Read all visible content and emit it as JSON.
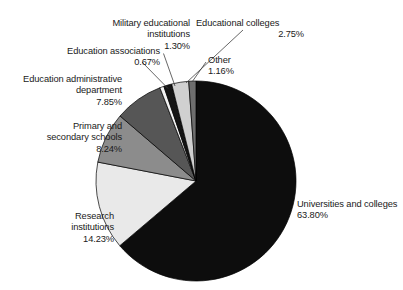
{
  "chart_data": {
    "type": "pie",
    "title": "",
    "subtitle": "",
    "xlabel": "",
    "ylabel": "",
    "legend_position": "none",
    "grid": false,
    "value_unit": "%",
    "start_angle_deg": 0,
    "direction": "clockwise",
    "categories": [
      "Universities and colleges",
      "Research institutions",
      "Primary and secondary schools",
      "Education administrative department",
      "Education associations",
      "Military educational institutions",
      "Educational colleges",
      "Other"
    ],
    "values": [
      63.8,
      14.23,
      8.24,
      7.85,
      0.67,
      1.3,
      2.75,
      1.16
    ],
    "slices": [
      {
        "label": "Universities and colleges",
        "value": 63.8,
        "value_text": "63.80%",
        "color": "#0d0d0d"
      },
      {
        "label": "Research institutions",
        "value": 14.23,
        "value_text": "14.23%",
        "color": "#e9e9e9"
      },
      {
        "label": "Primary and secondary schools",
        "value": 8.24,
        "value_text": "8.24%",
        "color": "#8c8c8c"
      },
      {
        "label": "Education administrative department",
        "value": 7.85,
        "value_text": "7.85%",
        "color": "#565656"
      },
      {
        "label": "Education associations",
        "value": 0.67,
        "value_text": "0.67%",
        "color": "#f2f2f2"
      },
      {
        "label": "Military educational institutions",
        "value": 1.3,
        "value_text": "1.30%",
        "color": "#141414"
      },
      {
        "label": "Educational colleges",
        "value": 2.75,
        "value_text": "2.75%",
        "color": "#d0d0d0"
      },
      {
        "label": "Other",
        "value": 1.16,
        "value_text": "1.16%",
        "color": "#6e6e6e"
      }
    ]
  },
  "labels": {
    "military": {
      "name": "Military educational\ninstitutions",
      "pct": "1.30%"
    },
    "eduassoc": {
      "name": "Education associations",
      "pct": "0.67%"
    },
    "eduadmin": {
      "name": "Education administrative\ndepartment",
      "pct": "7.85%"
    },
    "primary": {
      "name": "Primary and\nsecondary schools",
      "pct": "8.24%"
    },
    "research": {
      "name": "Research\ninstitutions",
      "pct": "14.23%"
    },
    "colleges": {
      "name": "Educational colleges",
      "pct": "2.75%"
    },
    "other": {
      "name": "Other",
      "pct": "1.16%"
    },
    "universities": {
      "name": "Universities and colleges",
      "pct": "63.80%"
    }
  },
  "style": {
    "background": "#ffffff",
    "text_color": "#1a1a1a",
    "leader_line_color": "#404040",
    "slice_outline": "#000000"
  }
}
